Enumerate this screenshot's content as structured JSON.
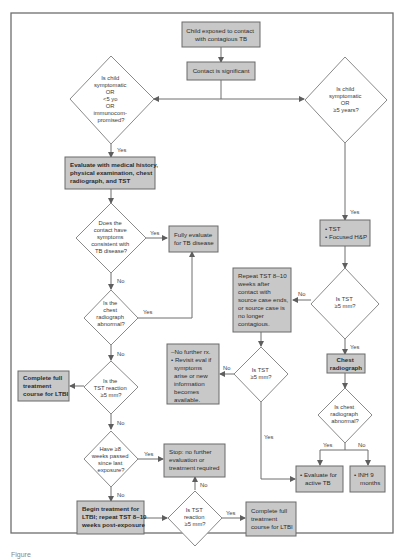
{
  "figure": {
    "caption": "Figure"
  },
  "nodes": {
    "start": {
      "lines": [
        "Child exposed to contact",
        "with contagious TB"
      ]
    },
    "contact_significant": {
      "lines": [
        "Contact is significant"
      ]
    },
    "q_left_risk": {
      "lines": [
        "Is child",
        "symptomatic",
        "OR",
        "<5 yo",
        "OR",
        "immunocom-",
        "promised?"
      ]
    },
    "q_right_risk": {
      "lines": [
        "Is child",
        "symptomatic",
        "OR",
        "≥5 years?"
      ]
    },
    "evaluate_history": {
      "lines": [
        "Evaluate with medical history,",
        "physical examination, chest",
        "radiograph, and TST"
      ]
    },
    "q_symptoms": {
      "lines": [
        "Does the",
        "contact have",
        "symptoms",
        "consistent with",
        "TB disease?"
      ]
    },
    "fully_evaluate": {
      "lines": [
        "Fully evaluate",
        "for TB disease"
      ]
    },
    "q_chest_abnormal_left": {
      "lines": [
        "Is the",
        "chest",
        "radiograph",
        "abnormal?"
      ]
    },
    "q_tst_left": {
      "lines": [
        "Is the",
        "TST reaction",
        "≥5 mm?"
      ]
    },
    "complete_ltbi_left": {
      "lines": [
        "Complete full",
        "treatment",
        "course for LTBI"
      ]
    },
    "q_8weeks": {
      "lines": [
        "Have ≥8",
        "weeks passed",
        "since last",
        "exposure?"
      ]
    },
    "stop_no_further": {
      "lines": [
        "Stop: no further",
        "evaluation or",
        "treatment required"
      ]
    },
    "begin_treatment": {
      "lines": [
        "Begin treatment for",
        "LTBI; repeat TST 8–10",
        "weeks post-exposure"
      ]
    },
    "q_tst_bottom": {
      "lines": [
        "Is TST",
        "reaction",
        "≥5 mm?"
      ]
    },
    "complete_ltbi_bottom": {
      "lines": [
        "Complete full",
        "treatment",
        "course for LTBI"
      ]
    },
    "tst_focused": {
      "lines": [
        "• TST",
        "• Focused H&P"
      ]
    },
    "q_tst_right": {
      "lines": [
        "Is TST",
        "≥5 mm?"
      ]
    },
    "repeat_tst": {
      "lines": [
        "Repeat TST 8–10",
        "weeks after",
        "contact with",
        "source case ends,",
        "or source case is",
        "no longer",
        "contagious."
      ]
    },
    "q_tst_middle": {
      "lines": [
        "Is TST",
        "≥5 mm?"
      ]
    },
    "no_further_rx": {
      "lines": [
        "–No further rx.",
        "• Revisit eval if",
        "symptoms",
        "arise or new",
        "information",
        "becomes",
        "available."
      ]
    },
    "chest_radiograph": {
      "lines": [
        "Chest",
        "radiograph"
      ]
    },
    "q_chest_abnormal_right": {
      "lines": [
        "Is chest",
        "radiograph",
        "abnormal?"
      ]
    },
    "evaluate_active_tb": {
      "lines": [
        "• Evaluate for",
        "active TB"
      ]
    },
    "inh_9_months": {
      "lines": [
        "• INH 9",
        "months"
      ]
    }
  },
  "edge_labels": {
    "yes": "Yes",
    "no": "No"
  },
  "colors": {
    "box_fill": "#c8c8c8",
    "box_stroke": "#6a6a6a",
    "line": "#6e6e6e",
    "diamond_fill": "#ffffff"
  }
}
